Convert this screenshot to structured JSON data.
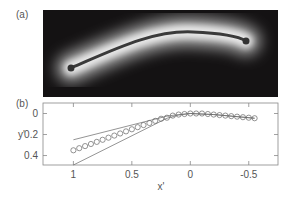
{
  "panels": {
    "a": {
      "label": "(a)"
    },
    "b": {
      "label": "(b)"
    }
  },
  "chart_data": {
    "type": "scatter",
    "title": "",
    "xlabel": "x'",
    "ylabel": "y'",
    "xlim": [
      1.26,
      -0.75
    ],
    "ylim": [
      -0.1,
      0.49
    ],
    "y_inverted": true,
    "x_inverted": true,
    "grid": false,
    "x_ticks": [
      1,
      0.5,
      0,
      -0.5
    ],
    "x_tick_labels": [
      "1",
      "0.5",
      "0",
      "-0.5"
    ],
    "y_ticks": [
      0,
      0.2,
      0.4
    ],
    "y_tick_labels": [
      "0",
      "0.2",
      "0.4"
    ],
    "series": [
      {
        "name": "measured",
        "style": "open-circles",
        "x": [
          1.0,
          0.95,
          0.9,
          0.85,
          0.8,
          0.75,
          0.7,
          0.65,
          0.6,
          0.55,
          0.5,
          0.45,
          0.4,
          0.35,
          0.3,
          0.25,
          0.2,
          0.15,
          0.1,
          0.05,
          0.0,
          -0.05,
          -0.1,
          -0.15,
          -0.2,
          -0.25,
          -0.3,
          -0.35,
          -0.4,
          -0.45,
          -0.5,
          -0.55
        ],
        "y": [
          0.35,
          0.33,
          0.31,
          0.29,
          0.27,
          0.25,
          0.23,
          0.21,
          0.19,
          0.17,
          0.15,
          0.13,
          0.11,
          0.09,
          0.07,
          0.05,
          0.04,
          0.02,
          0.01,
          0.005,
          0.0,
          0.0,
          0.0,
          0.005,
          0.01,
          0.015,
          0.02,
          0.025,
          0.03,
          0.035,
          0.04,
          0.045
        ]
      },
      {
        "name": "upper-bound",
        "style": "line",
        "x": [
          1.0,
          0.2,
          0.1,
          0.0,
          -0.2,
          -0.4,
          -0.55
        ],
        "y": [
          0.25,
          0.025,
          0.01,
          0.0,
          0.01,
          0.03,
          0.045
        ]
      },
      {
        "name": "lower-bound",
        "style": "line",
        "x": [
          1.0,
          0.2,
          0.1,
          0.0,
          -0.2,
          -0.4,
          -0.55
        ],
        "y": [
          0.49,
          0.045,
          0.015,
          0.0,
          0.01,
          0.03,
          0.045
        ]
      }
    ]
  }
}
